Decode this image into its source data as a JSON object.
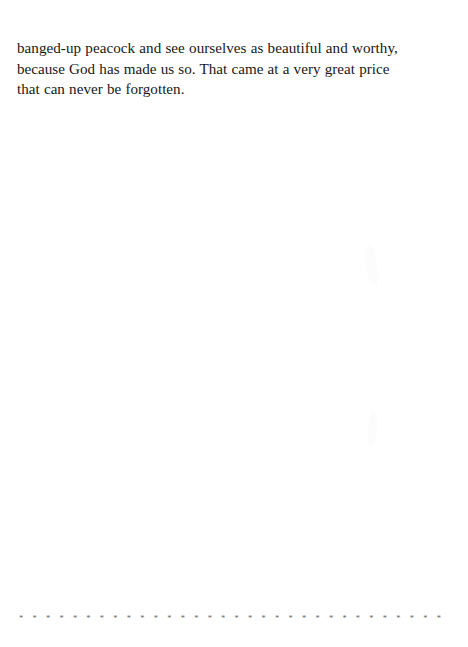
{
  "page": {
    "background_color": "#ffffff",
    "text_color": "#181818",
    "divider_color": "#6b6b6b",
    "width": 468,
    "height": 647
  },
  "body": {
    "paragraph": "banged-up peacock and see ourselves as beautiful and worthy, because God has made us so. That came at a very great price that can never be forgotten.",
    "lines": [
      "banged-up peacock and see ourselves as beautiful and worthy,",
      "because God has made us so. That came at a very great price",
      "that can never be forgotten."
    ]
  },
  "footer": {
    "divider_glyph": "*",
    "divider_count": 54,
    "divider": "* * * * * * * * * * * * * * * * * * * * * * * * * * * * * * * * * * * * * * * * * * * * * * * * * * * * *"
  },
  "artifacts": {
    "smudge_upper_label": "faint-scan-smudge",
    "smudge_lower_label": "faint-scan-smudge"
  }
}
